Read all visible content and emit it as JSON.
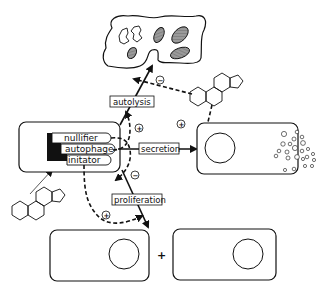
{
  "diagram": {
    "genes": [
      {
        "label": "nullifier"
      },
      {
        "label": "autophage"
      },
      {
        "label": "initator"
      }
    ],
    "processes": {
      "autolysis": "autolysis",
      "secretion": "secretion",
      "proliferation": "proliferation"
    },
    "signs": {
      "plus": "+",
      "minus": "−"
    },
    "plus_between_cells": "+",
    "colors": {
      "stroke": "#111111",
      "organelle_fill": "#8a8a8a",
      "background": "#ffffff"
    },
    "nodes": [
      "lysed-cell",
      "central-cell",
      "secreting-cell",
      "daughter-cell-left",
      "daughter-cell-right",
      "steroid-molecule-top",
      "steroid-molecule-bottom"
    ]
  }
}
